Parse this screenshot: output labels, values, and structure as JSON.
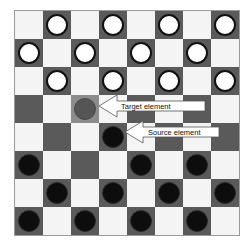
{
  "board": {
    "size": 8,
    "colors": {
      "light": "#f4f4f4",
      "dark": "#5a5a5a",
      "target_highlight": "#8c8c8c"
    },
    "pieces": [
      {
        "row": 0,
        "col": 1,
        "color": "white"
      },
      {
        "row": 0,
        "col": 3,
        "color": "white"
      },
      {
        "row": 0,
        "col": 5,
        "color": "white"
      },
      {
        "row": 0,
        "col": 7,
        "color": "white"
      },
      {
        "row": 1,
        "col": 0,
        "color": "white"
      },
      {
        "row": 1,
        "col": 2,
        "color": "white"
      },
      {
        "row": 1,
        "col": 4,
        "color": "white"
      },
      {
        "row": 1,
        "col": 6,
        "color": "white"
      },
      {
        "row": 2,
        "col": 1,
        "color": "white"
      },
      {
        "row": 2,
        "col": 3,
        "color": "white"
      },
      {
        "row": 2,
        "col": 5,
        "color": "white"
      },
      {
        "row": 2,
        "col": 7,
        "color": "white"
      },
      {
        "row": 3,
        "col": 2,
        "color": "ghost"
      },
      {
        "row": 4,
        "col": 3,
        "color": "black"
      },
      {
        "row": 5,
        "col": 0,
        "color": "black"
      },
      {
        "row": 5,
        "col": 4,
        "color": "black"
      },
      {
        "row": 5,
        "col": 6,
        "color": "black"
      },
      {
        "row": 6,
        "col": 1,
        "color": "black"
      },
      {
        "row": 6,
        "col": 3,
        "color": "black"
      },
      {
        "row": 6,
        "col": 5,
        "color": "black"
      },
      {
        "row": 6,
        "col": 7,
        "color": "black"
      },
      {
        "row": 7,
        "col": 0,
        "color": "black"
      },
      {
        "row": 7,
        "col": 2,
        "color": "black"
      },
      {
        "row": 7,
        "col": 4,
        "color": "black"
      },
      {
        "row": 7,
        "col": 6,
        "color": "black"
      }
    ],
    "target_cell": {
      "row": 3,
      "col": 2
    },
    "source_cell": {
      "row": 4,
      "col": 3
    }
  },
  "annotations": {
    "target_label": "Target element",
    "source_label": "Source element"
  }
}
